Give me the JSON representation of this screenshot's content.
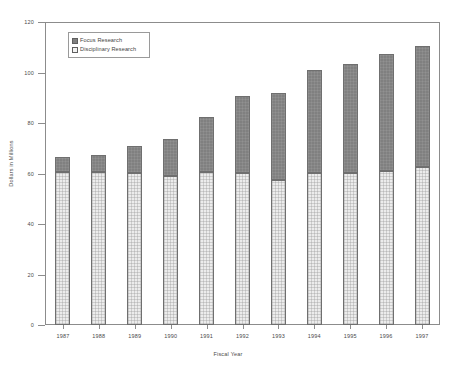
{
  "chart_data": {
    "type": "bar",
    "subtype": "stacked-vertical",
    "title": "",
    "xlabel": "Fiscal Year",
    "ylabel": "Dollars in Millions",
    "categories": [
      "1987",
      "1988",
      "1989",
      "1990",
      "1991",
      "1992",
      "1993",
      "1994",
      "1995",
      "1996",
      "1997"
    ],
    "series": [
      {
        "name": "Disciplinary Research",
        "color": "#ececec",
        "values": [
          60.5,
          60.5,
          60.0,
          59.0,
          60.5,
          60.0,
          57.5,
          60.0,
          60.0,
          61.0,
          62.5
        ]
      },
      {
        "name": "Focus Research",
        "color": "#808080",
        "values": [
          6.0,
          7.0,
          11.0,
          14.5,
          22.0,
          30.5,
          34.5,
          41.0,
          43.5,
          46.5,
          48.0
        ]
      }
    ],
    "totals": [
      66.5,
      67.5,
      71.0,
      73.5,
      82.5,
      90.5,
      92.0,
      101.0,
      103.5,
      107.5,
      110.5
    ],
    "ylim": [
      0,
      120
    ],
    "yticks": [
      0,
      20,
      40,
      60,
      80,
      100,
      120
    ],
    "ytick_labels": [
      "0",
      "20",
      "40",
      "60",
      "80",
      "100",
      "120"
    ],
    "grid": false,
    "legend_position": "top-left",
    "legend": [
      {
        "label": "Focus Research",
        "swatch": "focus"
      },
      {
        "label": "Disciplinary Research",
        "swatch": "disc"
      }
    ]
  },
  "colors": {
    "focus": "#808080",
    "disciplinary": "#ececec",
    "axis": "#8c8c8c",
    "text": "#4a4a4a",
    "background": "#ffffff"
  }
}
